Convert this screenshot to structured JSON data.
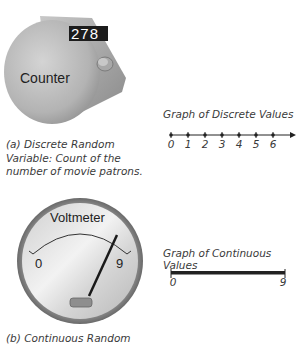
{
  "panel_a": {
    "device": {
      "label": "Counter",
      "display_value": "278",
      "icon": "tally-counter-icon"
    },
    "caption_lines": [
      "(a) Discrete Random",
      "Variable: Count of the",
      "number of movie patrons."
    ],
    "graph": {
      "title": "Graph of Discrete Values",
      "tick_labels": [
        "0",
        "1",
        "2",
        "3",
        "4",
        "5",
        "6"
      ]
    }
  },
  "panel_b": {
    "device": {
      "label": "Voltmeter",
      "scale_min": "0",
      "scale_max": "9",
      "icon": "voltmeter-gauge-icon"
    },
    "caption_lines": [
      "(b) Continuous Random"
    ],
    "graph": {
      "title": "Graph of Continuous Values",
      "min_label": "0",
      "max_label": "9"
    }
  },
  "colors": {
    "device_body": "#b9b9b9",
    "device_dark": "#1f1f1f",
    "line": "#222222",
    "text": "#3a3a3a"
  }
}
